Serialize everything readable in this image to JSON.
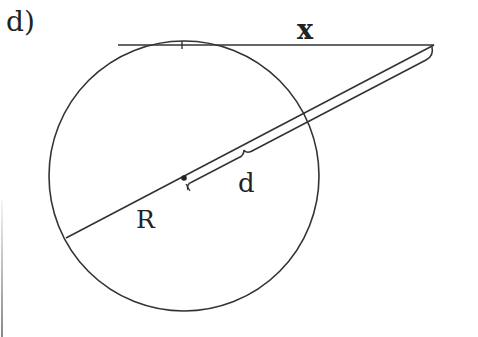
{
  "figure": {
    "part_label": "d)",
    "labels": {
      "tangent_length": "x",
      "distance": "d",
      "radius": "R"
    },
    "colors": {
      "stroke": "#333333",
      "background": "#ffffff"
    },
    "geometry": {
      "circle": {
        "cx": 184,
        "cy": 176,
        "r": 135
      },
      "tangent_line": {
        "x1": 118,
        "y1": 45,
        "x2": 434,
        "y2": 45
      },
      "tangent_point_tick_x": 182,
      "secant_line": {
        "x1": 434,
        "y1": 45,
        "x2": 66,
        "y2": 238
      },
      "center_dot": {
        "cx": 184,
        "cy": 178
      }
    }
  }
}
